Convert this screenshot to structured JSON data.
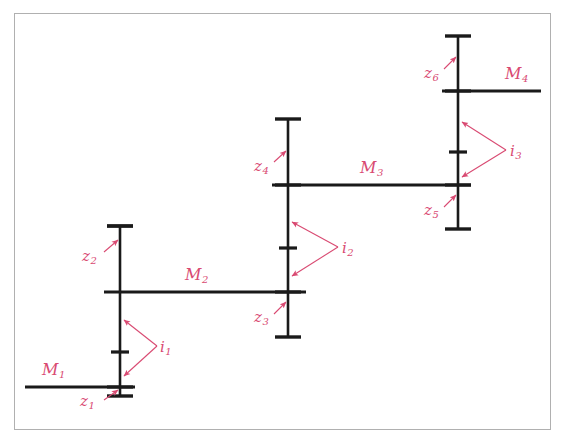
{
  "figure": {
    "type": "mechanical-schematic",
    "background_color": "#ffffff",
    "frame_color": "#b0b0b0",
    "shaft_color": "#1a1a1a",
    "annotation_color": "#d94a72"
  },
  "shafts": [
    {
      "id": "shaft-1",
      "x": 120,
      "y_top": 226,
      "y_bottom": 396,
      "cap_half_width": 13
    },
    {
      "id": "shaft-2",
      "x": 288,
      "y_top": 119,
      "y_bottom": 337,
      "cap_half_width": 13
    },
    {
      "id": "shaft-3",
      "x": 458,
      "y_top": 36,
      "y_bottom": 229,
      "cap_half_width": 13
    }
  ],
  "members": [
    {
      "label": "M",
      "index": "1",
      "y": 387,
      "x_start": 25,
      "x_end": 135,
      "label_x": 42,
      "label_y": 362
    },
    {
      "label": "M",
      "index": "2",
      "y": 292,
      "x_start": 104,
      "x_end": 306,
      "label_x": 185,
      "label_y": 267
    },
    {
      "label": "M",
      "index": "3",
      "y": 185,
      "x_start": 272,
      "x_end": 471,
      "label_x": 360,
      "label_y": 160
    },
    {
      "label": "M",
      "index": "4",
      "y": 91,
      "x_start": 442,
      "x_end": 541,
      "label_x": 505,
      "label_y": 66
    }
  ],
  "gears": [
    {
      "label": "z",
      "index": "1",
      "shaft": 1,
      "y": 387,
      "tick_half_width": 13,
      "label_x": 80,
      "label_y": 394,
      "arrow_from_x": 104,
      "arrow_from_y": 400,
      "arrow_to_x": 118,
      "arrow_to_y": 390
    },
    {
      "label": "z",
      "index": "2",
      "shaft": 1,
      "y": 226,
      "tick_half_width": 13,
      "label_x": 82,
      "label_y": 249,
      "arrow_from_x": 104,
      "arrow_from_y": 252,
      "arrow_to_x": 118,
      "arrow_to_y": 240
    },
    {
      "label": "z",
      "index": "3",
      "shaft": 2,
      "y": 292,
      "tick_half_width": 13,
      "label_x": 254,
      "label_y": 310,
      "arrow_from_x": 274,
      "arrow_from_y": 314,
      "arrow_to_x": 286,
      "arrow_to_y": 302
    },
    {
      "label": "z",
      "index": "4",
      "shaft": 2,
      "y": 185,
      "tick_half_width": 13,
      "label_x": 254,
      "label_y": 159,
      "arrow_from_x": 274,
      "arrow_from_y": 162,
      "arrow_to_x": 286,
      "arrow_to_y": 151
    },
    {
      "label": "z",
      "index": "5",
      "shaft": 3,
      "y": 185,
      "tick_half_width": 13,
      "label_x": 424,
      "label_y": 203,
      "arrow_from_x": 444,
      "arrow_from_y": 207,
      "arrow_to_x": 456,
      "arrow_to_y": 195
    },
    {
      "label": "z",
      "index": "6",
      "shaft": 3,
      "y": 91,
      "tick_half_width": 13,
      "label_x": 424,
      "label_y": 66,
      "arrow_from_x": 444,
      "arrow_from_y": 69,
      "arrow_to_x": 456,
      "arrow_to_y": 57
    }
  ],
  "inner_ticks": [
    {
      "shaft": 1,
      "y": 352,
      "half_width": 9
    },
    {
      "shaft": 2,
      "y": 248,
      "half_width": 9
    },
    {
      "shaft": 3,
      "y": 152,
      "half_width": 9
    }
  ],
  "distances": [
    {
      "label": "i",
      "index": "1",
      "label_x": 160,
      "label_y": 340,
      "apex_x": 157,
      "apex_y": 346,
      "arrow_upper_x": 124,
      "arrow_upper_y": 320,
      "arrow_lower_x": 124,
      "arrow_lower_y": 376
    },
    {
      "label": "i",
      "index": "2",
      "label_x": 342,
      "label_y": 241,
      "apex_x": 338,
      "apex_y": 247,
      "arrow_upper_x": 292,
      "arrow_upper_y": 222,
      "arrow_lower_x": 292,
      "arrow_lower_y": 276
    },
    {
      "label": "i",
      "index": "3",
      "label_x": 510,
      "label_y": 144,
      "apex_x": 506,
      "apex_y": 150,
      "arrow_upper_x": 462,
      "arrow_upper_y": 122,
      "arrow_lower_x": 462,
      "arrow_lower_y": 177
    }
  ]
}
